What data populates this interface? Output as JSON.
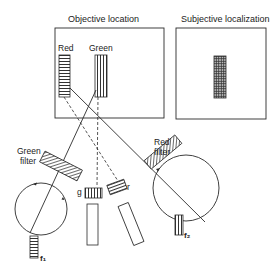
{
  "panels": {
    "objective": {
      "title": "Objective location"
    },
    "subjective": {
      "title": "Subjective localization"
    }
  },
  "stimuli": {
    "red_label": "Red",
    "green_label": "Green"
  },
  "filters": {
    "green_filter": [
      "Green",
      "filter"
    ],
    "red_filter": [
      "Red",
      "filter"
    ]
  },
  "projectors": {
    "g_label": "g",
    "r_label": "r"
  },
  "fixation": {
    "left_label": "f₁",
    "right_label": "f₂"
  },
  "colors": {
    "ink": "#2a2a2a",
    "background": "#ffffff"
  }
}
